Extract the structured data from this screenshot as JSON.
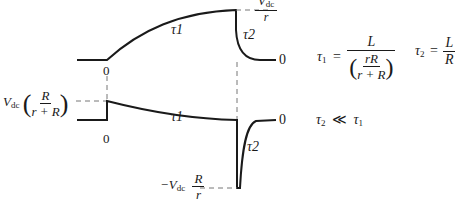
{
  "diagram": {
    "type": "waveform-timing-diagram",
    "colors": {
      "trace": "#1a1a1a",
      "dashed": "#777777",
      "background": "#ffffff"
    },
    "top_waveform": {
      "curve_label": "τ1",
      "fall_label": "τ2",
      "origin_label": "0",
      "end_label": "0",
      "peak_label": {
        "numerator": "V",
        "numerator_sub": "dc",
        "denominator": "r"
      }
    },
    "bottom_waveform": {
      "curve_label": "τ1",
      "spike_label": "τ2",
      "origin_label": "0",
      "end_label": "0",
      "step_label": {
        "prefix": "V",
        "prefix_sub": "dc",
        "num": "R",
        "den": "r + R"
      },
      "spike_min_label": {
        "prefix": "−V",
        "prefix_sub": "dc",
        "num": "R",
        "den": "r"
      }
    },
    "equations": {
      "tau1": {
        "lhs": "τ",
        "lhs_sub": "1",
        "eq": "=",
        "num": "L",
        "inner_num": "rR",
        "inner_den": "r + R"
      },
      "tau2": {
        "lhs": "τ",
        "lhs_sub": "2",
        "eq": "=",
        "num": "L",
        "den": "R"
      },
      "relation": {
        "lhs": "τ",
        "lhs_sub": "2",
        "op": "≪",
        "rhs": "τ",
        "rhs_sub": "1"
      }
    }
  }
}
